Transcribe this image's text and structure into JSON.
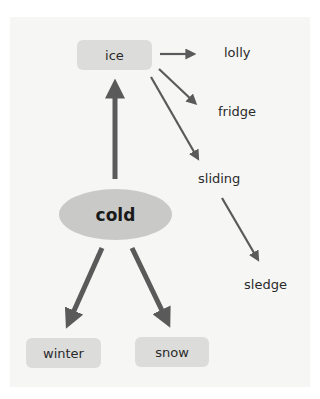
{
  "diagram": {
    "center": {
      "label": "cold"
    },
    "nodes": {
      "ice": "ice",
      "winter": "winter",
      "snow": "snow"
    },
    "words": {
      "lolly": "lolly",
      "fridge": "fridge",
      "sliding": "sliding",
      "sledge": "sledge"
    },
    "edges": [
      {
        "from": "cold",
        "to": "ice"
      },
      {
        "from": "cold",
        "to": "winter"
      },
      {
        "from": "cold",
        "to": "snow"
      },
      {
        "from": "ice",
        "to": "lolly"
      },
      {
        "from": "ice",
        "to": "fridge"
      },
      {
        "from": "ice",
        "to": "sliding"
      },
      {
        "from": "sliding",
        "to": "sledge"
      }
    ],
    "colors": {
      "arrow": "#5a5a5a",
      "box": "#dcdcdb",
      "ellipse": "#c9c9c8",
      "panel": "#f6f6f5"
    }
  }
}
